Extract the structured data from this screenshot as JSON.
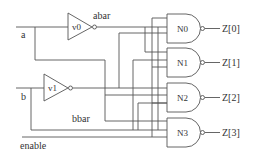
{
  "diagram": {
    "type": "2-to-4 decoder (NAND)",
    "inputs": [
      {
        "id": "a",
        "label": "a"
      },
      {
        "id": "b",
        "label": "b"
      },
      {
        "id": "enable",
        "label": "enable"
      }
    ],
    "inverters": [
      {
        "id": "v0",
        "label": "v0",
        "output_label": "abar"
      },
      {
        "id": "v1",
        "label": "v1",
        "output_label": "bbar"
      }
    ],
    "gates": [
      {
        "id": "N0",
        "label": "N0",
        "output": "Z[0]"
      },
      {
        "id": "N1",
        "label": "N1",
        "output": "Z[1]"
      },
      {
        "id": "N2",
        "label": "N2",
        "output": "Z[2]"
      },
      {
        "id": "N3",
        "label": "N3",
        "output": "Z[3]"
      }
    ],
    "colors": {
      "wire": "#555555",
      "background": "#ffffff"
    }
  }
}
